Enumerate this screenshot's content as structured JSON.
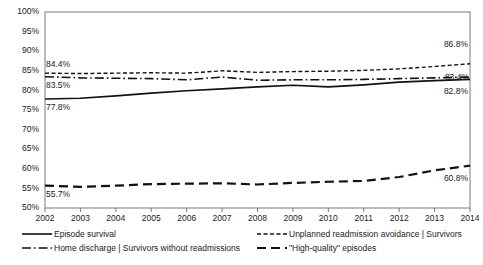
{
  "chart_data": {
    "type": "line",
    "title": "",
    "subtitle": "",
    "xlabel": "",
    "ylabel": "",
    "x": [
      2002,
      2003,
      2004,
      2005,
      2006,
      2007,
      2008,
      2009,
      2010,
      2011,
      2012,
      2013,
      2014
    ],
    "categories": [
      "2002",
      "2003",
      "2004",
      "2005",
      "2006",
      "2007",
      "2008",
      "2009",
      "2010",
      "2011",
      "2012",
      "2013",
      "2014"
    ],
    "xlim": [
      2002,
      2014
    ],
    "ylim": [
      50,
      100
    ],
    "ytick_values": [
      50,
      55,
      60,
      65,
      70,
      75,
      80,
      85,
      90,
      95,
      100
    ],
    "ytick_labels": [
      "50%",
      "55%",
      "60%",
      "65%",
      "70%",
      "75%",
      "80%",
      "85%",
      "90%",
      "95%",
      "100%"
    ],
    "grid": false,
    "legend_position": "bottom",
    "series": [
      {
        "name": "Episode survival",
        "style": "solid",
        "values": [
          77.8,
          78.0,
          78.6,
          79.3,
          79.9,
          80.4,
          80.9,
          81.3,
          80.9,
          81.4,
          82.1,
          82.5,
          82.8
        ]
      },
      {
        "name": "Home discharge | Survivors without readmissions",
        "style": "dash-dot",
        "values": [
          83.5,
          83.2,
          83.1,
          83.0,
          82.7,
          83.4,
          82.6,
          82.7,
          82.7,
          82.8,
          83.0,
          83.2,
          83.4
        ]
      },
      {
        "name": "Unplanned readmission avoidance | Survivors",
        "style": "dotted-dash",
        "values": [
          84.4,
          84.3,
          84.4,
          84.5,
          84.4,
          85.0,
          84.6,
          84.8,
          84.9,
          85.1,
          85.5,
          86.1,
          86.8
        ]
      },
      {
        "name": "\"High-quality\" episodes",
        "style": "long-dash",
        "values": [
          55.7,
          55.4,
          55.7,
          56.1,
          56.2,
          56.3,
          56.0,
          56.4,
          56.7,
          56.9,
          57.9,
          59.6,
          60.8
        ]
      }
    ],
    "annotations": [
      {
        "text": "84.4%",
        "series": "Unplanned readmission avoidance | Survivors",
        "x": 2002,
        "value": 84.4,
        "position": "above-left"
      },
      {
        "text": "83.5%",
        "series": "Home discharge | Survivors without readmissions",
        "x": 2002,
        "value": 83.5,
        "position": "below-left"
      },
      {
        "text": "77.8%",
        "series": "Episode survival",
        "x": 2002,
        "value": 77.8,
        "position": "below-left"
      },
      {
        "text": "55.7%",
        "series": "\"High-quality\" episodes",
        "x": 2002,
        "value": 55.7,
        "position": "below-left"
      },
      {
        "text": "86.8%",
        "series": "Unplanned readmission avoidance | Survivors",
        "x": 2014,
        "value": 86.8,
        "position": "above-right"
      },
      {
        "text": "83.4%",
        "series": "Home discharge | Survivors without readmissions",
        "x": 2014,
        "value": 83.4,
        "position": "right"
      },
      {
        "text": "82.8%",
        "series": "Episode survival",
        "x": 2014,
        "value": 82.8,
        "position": "below-right"
      },
      {
        "text": "60.8%",
        "series": "\"High-quality\" episodes",
        "x": 2014,
        "value": 60.8,
        "position": "below-right"
      }
    ]
  },
  "legend": {
    "entries": [
      {
        "label": "Episode survival",
        "style": "solid"
      },
      {
        "label": "Unplanned readmission avoidance | Survivors",
        "style": "dotted-dash"
      },
      {
        "label": "Home discharge | Survivors without readmissions",
        "style": "dash-dot"
      },
      {
        "label": "\"High-quality\" episodes",
        "style": "long-dash"
      }
    ]
  },
  "colors": {
    "line": "#111111",
    "axis": "#7a7a7a",
    "text": "#1a1a1a",
    "background": "#ffffff"
  }
}
